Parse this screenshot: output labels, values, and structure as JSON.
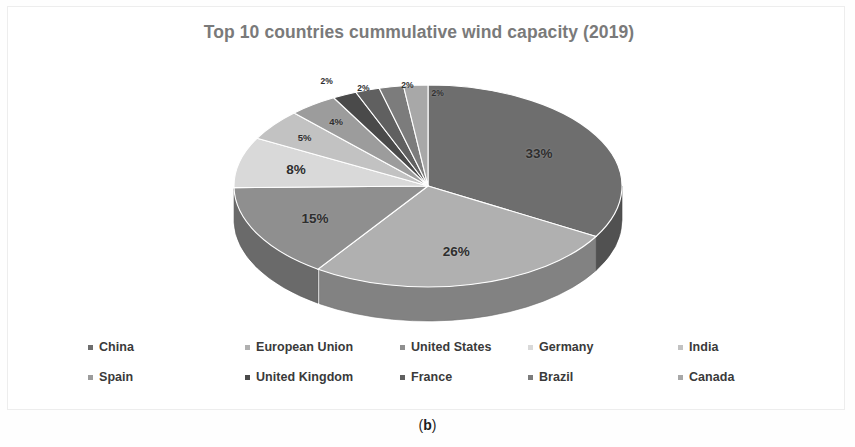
{
  "figure": {
    "caption": "(b)",
    "caption_open": "(",
    "caption_letter": "b",
    "caption_close": ")"
  },
  "chart": {
    "title": "Top 10 countries cummulative wind capacity (2019)",
    "title_color": "#7a7a7a",
    "background": "#ffffff",
    "border_color": "#ededed"
  },
  "legend": {
    "position": "bottom",
    "rows": [
      [
        {
          "label": "China",
          "color": "#6e6e6e"
        },
        {
          "label": "European Union",
          "color": "#b0b0b0"
        },
        {
          "label": "United States",
          "color": "#8f8f8f"
        },
        {
          "label": "Germany",
          "color": "#d9d9d9"
        },
        {
          "label": "India",
          "color": "#c2c2c2"
        }
      ],
      [
        {
          "label": "Spain",
          "color": "#9c9c9c"
        },
        {
          "label": "United Kingdom",
          "color": "#4a4a4a"
        },
        {
          "label": "France",
          "color": "#606060"
        },
        {
          "label": "Brazil",
          "color": "#7c7c7c"
        },
        {
          "label": "Canada",
          "color": "#a8a8a8"
        }
      ]
    ]
  },
  "chart_data": {
    "type": "pie",
    "title": "Top 10 countries cummulative wind capacity (2019)",
    "xlabel": "",
    "ylabel": "",
    "unit": "percent",
    "three_d": true,
    "legend_position": "bottom",
    "grid": false,
    "labels": [
      "China",
      "European Union",
      "United States",
      "Germany",
      "India",
      "Spain",
      "United Kingdom",
      "France",
      "Brazil",
      "Canada"
    ],
    "values": [
      33,
      26,
      15,
      8,
      5,
      4,
      2,
      2,
      2,
      2
    ],
    "data_labels": [
      "33%",
      "26%",
      "15%",
      "8%",
      "5%",
      "4%",
      "2%",
      "2%",
      "2%",
      "2%"
    ],
    "colors": [
      "#6e6e6e",
      "#b0b0b0",
      "#8f8f8f",
      "#d9d9d9",
      "#c2c2c2",
      "#9c9c9c",
      "#4a4a4a",
      "#606060",
      "#7c7c7c",
      "#a8a8a8"
    ],
    "slices": [
      {
        "name": "China",
        "value": 33,
        "label": "33%",
        "color": "#6e6e6e"
      },
      {
        "name": "European Union",
        "value": 26,
        "label": "26%",
        "color": "#b0b0b0"
      },
      {
        "name": "United States",
        "value": 15,
        "label": "15%",
        "color": "#8f8f8f"
      },
      {
        "name": "Germany",
        "value": 8,
        "label": "8%",
        "color": "#d9d9d9"
      },
      {
        "name": "India",
        "value": 5,
        "label": "5%",
        "color": "#c2c2c2"
      },
      {
        "name": "Spain",
        "value": 4,
        "label": "4%",
        "color": "#9c9c9c"
      },
      {
        "name": "United Kingdom",
        "value": 2,
        "label": "2%",
        "color": "#4a4a4a"
      },
      {
        "name": "France",
        "value": 2,
        "label": "2%",
        "color": "#606060"
      },
      {
        "name": "Brazil",
        "value": 2,
        "label": "2%",
        "color": "#7c7c7c"
      },
      {
        "name": "Canada",
        "value": 2,
        "label": "2%",
        "color": "#a8a8a8"
      }
    ]
  }
}
